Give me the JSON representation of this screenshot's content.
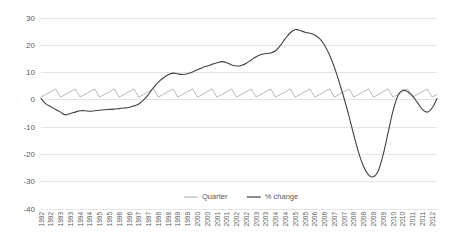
{
  "chart_data": {
    "type": "line",
    "title": "",
    "subtitle": "",
    "xlabel": "",
    "ylabel": "",
    "ylim": [
      -40,
      30
    ],
    "yticks": [
      30,
      20,
      10,
      0,
      -10,
      -20,
      -30,
      -40
    ],
    "ytick_labels": [
      "30",
      "20",
      "10",
      "0",
      "-10",
      "-20",
      "-30",
      "-40"
    ],
    "grid": true,
    "grid_axis": "y",
    "legend": [
      "Quarter",
      "% change"
    ],
    "legend_position": "bottom-center",
    "x": [
      "1992",
      "1992",
      "1992",
      "1992",
      "1993",
      "1993",
      "1993",
      "1993",
      "1994",
      "1994",
      "1994",
      "1994",
      "1995",
      "1995",
      "1995",
      "1995",
      "1996",
      "1996",
      "1996",
      "1996",
      "1997",
      "1997",
      "1997",
      "1997",
      "1998",
      "1998",
      "1998",
      "1998",
      "1999",
      "1999",
      "1999",
      "1999",
      "2000",
      "2000",
      "2000",
      "2000",
      "2001",
      "2001",
      "2001",
      "2001",
      "2002",
      "2002",
      "2002",
      "2002",
      "2003",
      "2003",
      "2003",
      "2003",
      "2004",
      "2004",
      "2004",
      "2004",
      "2005",
      "2005",
      "2005",
      "2005",
      "2006",
      "2006",
      "2006",
      "2006",
      "2007",
      "2007",
      "2007",
      "2007",
      "2008",
      "2008",
      "2008",
      "2008",
      "2009",
      "2009",
      "2009",
      "2009",
      "2010",
      "2010",
      "2010",
      "2010",
      "2011",
      "2011",
      "2011",
      "2011",
      "2012",
      "2012"
    ],
    "xtick_labels": [
      "1992",
      "1992",
      "1993",
      "1993",
      "1994",
      "1994",
      "1995",
      "1995",
      "1996",
      "1996",
      "1997",
      "1997",
      "1998",
      "1998",
      "1999",
      "1999",
      "2000",
      "2000",
      "2001",
      "2001",
      "2002",
      "2002",
      "2003",
      "2003",
      "2004",
      "2004",
      "2005",
      "2005",
      "2006",
      "2006",
      "2007",
      "2007",
      "2008",
      "2008",
      "2009",
      "2009",
      "2010",
      "2010",
      "2011",
      "2011",
      "2012"
    ],
    "xtick_rotation": 90,
    "series": [
      {
        "name": "Quarter",
        "color": "#a6a6a6",
        "values": [
          1,
          2,
          3,
          4,
          1,
          2,
          3,
          4,
          1,
          2,
          3,
          4,
          1,
          2,
          3,
          4,
          1,
          2,
          3,
          4,
          1,
          2,
          3,
          4,
          1,
          2,
          3,
          4,
          1,
          2,
          3,
          4,
          1,
          2,
          3,
          4,
          1,
          2,
          3,
          4,
          1,
          2,
          3,
          4,
          1,
          2,
          3,
          4,
          1,
          2,
          3,
          4,
          1,
          2,
          3,
          4,
          1,
          2,
          3,
          4,
          1,
          2,
          3,
          4,
          1,
          2,
          3,
          4,
          1,
          2,
          3,
          4,
          1,
          2,
          3,
          4,
          1,
          2,
          3,
          4,
          1,
          2
        ]
      },
      {
        "name": "% change",
        "color": "#404040",
        "values": [
          0.5,
          -1.5,
          -2.5,
          -3.5,
          -4.5,
          -5.5,
          -5.0,
          -4.5,
          -4.0,
          -4.0,
          -4.2,
          -4.0,
          -3.8,
          -3.6,
          -3.5,
          -3.4,
          -3.2,
          -3.0,
          -2.8,
          -2.2,
          -1.5,
          0.0,
          2.0,
          4.5,
          6.5,
          8.0,
          9.2,
          9.8,
          9.5,
          9.3,
          9.6,
          10.2,
          11.0,
          11.8,
          12.4,
          13.0,
          13.6,
          14.0,
          13.6,
          12.8,
          12.4,
          12.6,
          13.4,
          14.6,
          15.8,
          16.6,
          17.0,
          17.2,
          18.0,
          20.0,
          22.5,
          24.6,
          25.8,
          25.4,
          24.8,
          24.4,
          23.8,
          22.4,
          20.0,
          16.5,
          12.0,
          6.5,
          0.5,
          -6.0,
          -13.0,
          -19.5,
          -24.5,
          -27.5,
          -28.2,
          -26.0,
          -20.0,
          -12.0,
          -4.0,
          1.5,
          3.5,
          3.0,
          1.5,
          -1.0,
          -3.5,
          -4.5,
          -3.0,
          0.5
        ]
      }
    ]
  }
}
